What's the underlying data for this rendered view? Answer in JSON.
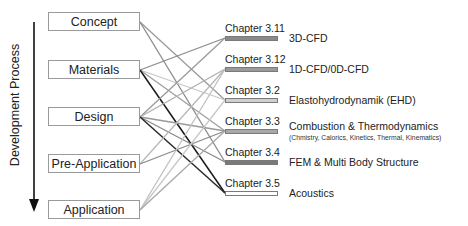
{
  "diagram": {
    "axis_label": "Development Process",
    "stages": [
      {
        "label": "Concept",
        "y": 22
      },
      {
        "label": "Materials",
        "y": 70
      },
      {
        "label": "Design",
        "y": 117
      },
      {
        "label": "Pre-Application",
        "y": 164
      },
      {
        "label": "Application",
        "y": 210
      }
    ],
    "chapters": [
      {
        "label": "Chapter 3.11",
        "topic": "3D-CFD",
        "subtopic": "",
        "bar_color": "#8a8a8a",
        "y": 38
      },
      {
        "label": "Chapter 3.12",
        "topic": "1D-CFD/0D-CFD",
        "subtopic": "",
        "bar_color": "#9a9a9a",
        "y": 69
      },
      {
        "label": "Chapter 3.2",
        "topic": "Elastohydrodynamik (EHD)",
        "subtopic": "",
        "bar_color": "#cfcfcf",
        "y": 100
      },
      {
        "label": "Chapter 3.3",
        "topic": "Combustion & Thermodynamics",
        "subtopic": "(Chmistry, Calorics, Kinetics, Thermal, Kinematics)",
        "bar_color": "#a8a8a8",
        "y": 131
      },
      {
        "label": "Chapter 3.4",
        "topic": "FEM & Multi Body Structure",
        "subtopic": "",
        "bar_color": "#7a7a7a",
        "y": 162
      },
      {
        "label": "Chapter 3.5",
        "topic": "Acoustics",
        "subtopic": "",
        "bar_color": "#ffffff",
        "y": 193
      }
    ],
    "connections": [
      {
        "from": 0,
        "to": 2,
        "color": "#9a9a9a"
      },
      {
        "from": 0,
        "to": 4,
        "color": "#8a8a8a"
      },
      {
        "from": 1,
        "to": 0,
        "color": "#8a8a8a"
      },
      {
        "from": 1,
        "to": 2,
        "color": "#c8c8c8"
      },
      {
        "from": 1,
        "to": 3,
        "color": "#a0a0a0"
      },
      {
        "from": 1,
        "to": 5,
        "color": "#1a1a1a"
      },
      {
        "from": 2,
        "to": 0,
        "color": "#9a9a9a"
      },
      {
        "from": 2,
        "to": 1,
        "color": "#b0b0b0"
      },
      {
        "from": 2,
        "to": 3,
        "color": "#9a9a9a"
      },
      {
        "from": 2,
        "to": 4,
        "color": "#8a8a8a"
      },
      {
        "from": 2,
        "to": 5,
        "color": "#2a2a2a"
      },
      {
        "from": 3,
        "to": 1,
        "color": "#b8b8b8"
      },
      {
        "from": 3,
        "to": 3,
        "color": "#8a8a8a"
      },
      {
        "from": 4,
        "to": 1,
        "color": "#c0c0c0"
      },
      {
        "from": 4,
        "to": 2,
        "color": "#c8c8c8"
      },
      {
        "from": 4,
        "to": 3,
        "color": "#a8a8a8"
      }
    ]
  }
}
